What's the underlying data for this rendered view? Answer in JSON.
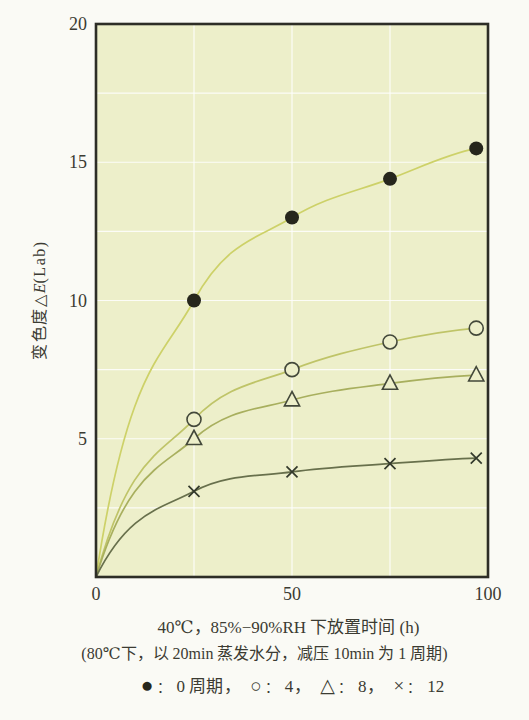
{
  "figure": {
    "colors": {
      "outer_bg": "#fafaf5",
      "plot_bg": "#edefca",
      "grid": "#ffffff",
      "frame": "#2d2d26",
      "text": "#3b3b32"
    },
    "ylabel": {
      "prefix": "变色度",
      "symbol": "△",
      "e": "E",
      "suffix": "(Lab)"
    },
    "caption": {
      "line1": "40℃，85%−90%RH 下放置时间 (h)",
      "line2": "(80℃下，以 20min 蒸发水分，减压 10min 为 1 周期)"
    },
    "legend": {
      "colon": "：",
      "separator": "，",
      "items": [
        {
          "glyph": "●",
          "label": "0 周期"
        },
        {
          "glyph": "○",
          "label": "4"
        },
        {
          "glyph": "△",
          "label": "8"
        },
        {
          "glyph": "×",
          "label": "12"
        }
      ]
    }
  },
  "chart_data": {
    "type": "line",
    "title": "",
    "xlabel": "40℃，85%−90%RH 下放置时间 (h)",
    "xlabel_note": "(80℃下，以 20min 蒸发水分，减压 10min 为 1 周期)",
    "ylabel": "变色度△E(Lab)",
    "xlim": [
      0,
      100
    ],
    "ylim": [
      0,
      20
    ],
    "xticks": [
      0,
      50,
      100
    ],
    "yticks": [
      5,
      10,
      15,
      20
    ],
    "grid": true,
    "x_gridlines": [
      25,
      50,
      75
    ],
    "y_gridline_step": 2.5,
    "legend_position": "bottom",
    "x": [
      0,
      25,
      50,
      75,
      97
    ],
    "series": [
      {
        "name": "0 周期",
        "marker": "filled-circle",
        "color": "#cdd168",
        "marker_color": "#26261c",
        "values": [
          0,
          10.0,
          13.0,
          14.4,
          15.5
        ]
      },
      {
        "name": "4",
        "marker": "open-circle",
        "color": "#bfc468",
        "marker_color": "#43483a",
        "values": [
          0,
          5.7,
          7.5,
          8.5,
          9.0
        ]
      },
      {
        "name": "8",
        "marker": "triangle",
        "color": "#a8af5e",
        "marker_color": "#43483a",
        "values": [
          0,
          5.0,
          6.4,
          7.0,
          7.3
        ]
      },
      {
        "name": "12",
        "marker": "x",
        "color": "#68704c",
        "marker_color": "#343a2c",
        "values": [
          0,
          3.1,
          3.8,
          4.1,
          4.3
        ]
      }
    ]
  }
}
